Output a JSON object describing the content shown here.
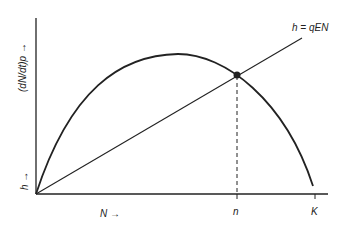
{
  "diagram": {
    "y_axis_label": "(dN/dt)p →",
    "h_axis_label": "h →",
    "x_axis_label": "N →",
    "line_label": "h = qEN",
    "tick_n": "n",
    "tick_K": "K",
    "curve": "parabolic growth curve (dN/dt)p vs N, zero at origin and at K",
    "line": "straight harvest line h = qEN from origin",
    "intersection": "equilibrium point at N = n, dashed drop line to x-axis",
    "colors": {
      "stroke": "#222222",
      "background": "#ffffff"
    }
  }
}
